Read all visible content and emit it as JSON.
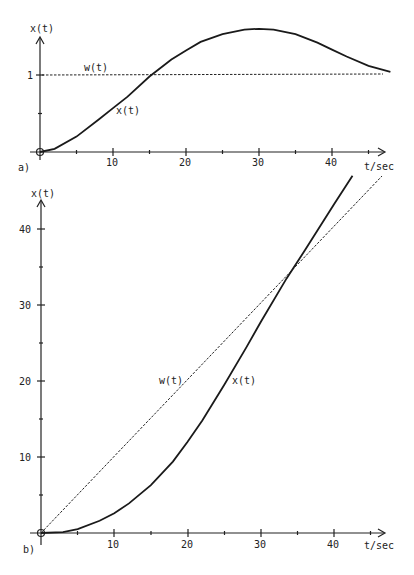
{
  "chart_data": [
    {
      "type": "line",
      "panel_label": "a)",
      "title": "",
      "xlabel": "t/sec",
      "ylabel": "x(t)",
      "xlim": [
        0,
        48
      ],
      "ylim": [
        0,
        1.7
      ],
      "x_ticks": [
        0,
        5,
        10,
        15,
        20,
        25,
        30,
        35,
        40,
        45
      ],
      "x_tick_labels": [
        "10",
        "20",
        "30",
        "40"
      ],
      "y_ticks": [
        0.5,
        1
      ],
      "y_tick_labels": [
        "1"
      ],
      "grid": false,
      "series": [
        {
          "name": "x(t)",
          "style": "solid",
          "x": [
            0,
            2,
            5,
            8,
            10,
            12,
            15,
            18,
            20,
            22,
            25,
            28,
            30,
            32,
            35,
            38,
            40,
            42,
            45,
            48
          ],
          "values": [
            0,
            0.04,
            0.2,
            0.42,
            0.57,
            0.72,
            0.98,
            1.2,
            1.32,
            1.43,
            1.53,
            1.59,
            1.6,
            1.59,
            1.53,
            1.42,
            1.33,
            1.24,
            1.12,
            1.04
          ]
        },
        {
          "name": "w(t)",
          "style": "dashed",
          "x": [
            0,
            47
          ],
          "values": [
            1,
            1
          ]
        }
      ],
      "annotations": [
        "w(t)",
        "x(t)"
      ]
    },
    {
      "type": "line",
      "panel_label": "b)",
      "title": "",
      "xlabel": "t/sec",
      "ylabel": "x(t)",
      "xlim": [
        0,
        46
      ],
      "ylim": [
        0,
        47
      ],
      "x_ticks": [
        0,
        5,
        10,
        15,
        20,
        25,
        30,
        35,
        40,
        45
      ],
      "x_tick_labels": [
        "10",
        "20",
        "30",
        "40"
      ],
      "y_ticks": [
        5,
        10,
        15,
        20,
        25,
        30,
        35,
        40
      ],
      "y_tick_labels": [
        "10",
        "20",
        "30",
        "40"
      ],
      "grid": false,
      "series": [
        {
          "name": "x(t)",
          "style": "solid",
          "x": [
            0,
            3,
            5,
            8,
            10,
            12,
            15,
            18,
            20,
            22,
            25,
            28,
            30,
            33.5,
            36,
            40,
            42.5
          ],
          "values": [
            0,
            0.1,
            0.5,
            1.6,
            2.6,
            3.9,
            6.3,
            9.4,
            12,
            14.8,
            19.5,
            24.4,
            27.8,
            33.5,
            37.2,
            43.3,
            47
          ]
        },
        {
          "name": "w(t)",
          "style": "dashed",
          "x": [
            0,
            46.5
          ],
          "values": [
            0,
            46.5
          ]
        }
      ],
      "annotations": [
        "w(t)",
        "x(t)"
      ]
    }
  ],
  "panel_a": {
    "label": "a)",
    "y_axis_label": "x(t)",
    "x_axis_label": "t/sec",
    "y_tick_1": "1",
    "x_tick_10": "10",
    "x_tick_20": "20",
    "x_tick_30": "30",
    "x_tick_40": "40",
    "legend_w": "w(t)",
    "legend_x": "x(t)"
  },
  "panel_b": {
    "label": "b)",
    "y_axis_label": "x(t)",
    "x_axis_label": "t/sec",
    "y_tick_10": "10",
    "y_tick_20": "20",
    "y_tick_30": "30",
    "y_tick_40": "40",
    "x_tick_10": "10",
    "x_tick_20": "20",
    "x_tick_30": "30",
    "x_tick_40": "40",
    "legend_w": "w(t)",
    "legend_x": "x(t)"
  }
}
